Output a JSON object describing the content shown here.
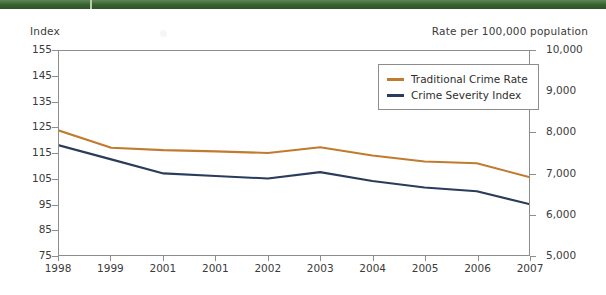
{
  "figure": {
    "top_band_color": "#3c6b33",
    "left_axis_title": "Index",
    "right_axis_title": "Rate per 100,000 population"
  },
  "legend": {
    "position": "top-right-inside",
    "entries": [
      {
        "label": "Traditional Crime Rate",
        "color": "#c07b2e"
      },
      {
        "label": "Crime Severity Index",
        "color": "#2a3b5c"
      }
    ]
  },
  "chart_data": {
    "type": "line",
    "title": "",
    "xlabel": "",
    "ylabel": "Index",
    "y2label": "Rate per 100,000 population",
    "grid": false,
    "legend_position": "top-right-inside",
    "categories": [
      "1998",
      "1999",
      "2001",
      "2001",
      "2002",
      "2003",
      "2004",
      "2005",
      "2006",
      "2007"
    ],
    "ylim": [
      75,
      155
    ],
    "yticks": [
      75,
      85,
      95,
      105,
      115,
      125,
      135,
      145,
      155
    ],
    "ytick_labels": [
      "75",
      "85",
      "95",
      "105",
      "115",
      "125",
      "135",
      "145",
      "155"
    ],
    "y2lim": [
      5000,
      10000
    ],
    "y2ticks": [
      5000,
      6000,
      7000,
      8000,
      9000,
      10000
    ],
    "y2tick_labels": [
      "5,000",
      "6,000",
      "7,000",
      "8,000",
      "9,000",
      "10,000"
    ],
    "series": [
      {
        "name": "Traditional Crime Rate",
        "color": "#c07b2e",
        "axis": "right",
        "values": [
          8050,
          7630,
          7570,
          7540,
          7500,
          7640,
          7440,
          7290,
          7250,
          6910
        ]
      },
      {
        "name": "Crime Severity Index",
        "color": "#2a3b5c",
        "axis": "left",
        "values": [
          118.0,
          112.5,
          107.0,
          106.0,
          105.0,
          107.5,
          104.0,
          101.5,
          100.0,
          95.0
        ]
      }
    ]
  }
}
